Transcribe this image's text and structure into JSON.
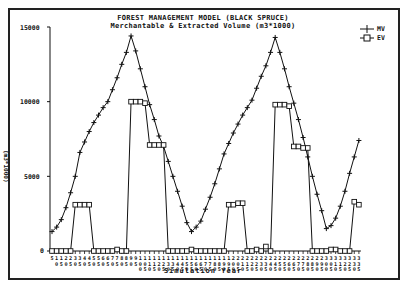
{
  "chart_data": {
    "type": "line",
    "title": "FOREST MANAGEMENT MODEL (BLACK SPRUCE)",
    "subtitle": "Merchantable & Extracted Volume (m3*1000)",
    "xlabel": "Simulation Year",
    "ylabel": "(m3*1000)",
    "ylim": [
      0,
      15000
    ],
    "yticks": [
      "0",
      "5000",
      "10000",
      "15000"
    ],
    "grid": false,
    "legend_position": "top-right",
    "x": [
      5,
      10,
      15,
      20,
      25,
      30,
      35,
      40,
      45,
      50,
      55,
      60,
      65,
      70,
      75,
      80,
      85,
      90,
      95,
      100,
      105,
      110,
      115,
      120,
      125,
      130,
      135,
      140,
      145,
      150,
      155,
      160,
      165,
      170,
      175,
      180,
      185,
      190,
      195,
      200,
      205,
      210,
      215,
      220,
      225,
      230,
      235,
      240,
      245,
      250,
      255,
      260,
      265,
      270,
      275,
      280,
      285,
      290,
      295,
      300,
      305,
      310,
      315,
      320,
      325,
      330,
      335
    ],
    "series": [
      {
        "name": "MV",
        "marker": "plus",
        "values": [
          1300,
          1600,
          2100,
          2900,
          3900,
          5000,
          6600,
          7300,
          8000,
          8600,
          9100,
          9600,
          10000,
          10800,
          11600,
          12500,
          13300,
          14400,
          13400,
          12200,
          11000,
          9800,
          8800,
          7700,
          7000,
          6000,
          5000,
          4000,
          3000,
          1900,
          1300,
          1600,
          2000,
          2800,
          3600,
          4500,
          5500,
          6500,
          7200,
          7900,
          8500,
          9100,
          9600,
          10100,
          10900,
          11700,
          12400,
          13300,
          14300,
          13300,
          12200,
          11000,
          9900,
          8800,
          7600,
          6300,
          5000,
          3800,
          2700,
          1500,
          1700,
          2200,
          3000,
          4000,
          5200,
          6300,
          7400
        ]
      },
      {
        "name": "EV",
        "marker": "square",
        "values": [
          0,
          0,
          0,
          0,
          0,
          3100,
          3100,
          3100,
          3100,
          0,
          0,
          0,
          0,
          0,
          100,
          0,
          0,
          10000,
          10000,
          10000,
          9900,
          7100,
          7100,
          7100,
          7100,
          0,
          0,
          0,
          0,
          0,
          100,
          0,
          0,
          0,
          0,
          0,
          0,
          0,
          3100,
          3100,
          3200,
          3200,
          0,
          0,
          100,
          0,
          300,
          0,
          9800,
          9800,
          9800,
          9700,
          7000,
          7000,
          6900,
          6900,
          0,
          0,
          0,
          0,
          100,
          100,
          0,
          0,
          0,
          3300,
          3100
        ]
      }
    ]
  },
  "header": {
    "title": "FOREST MANAGEMENT MODEL (BLACK SPRUCE)",
    "subtitle": "Merchantable & Extracted Volume (m3*1000)"
  },
  "axes": {
    "y_ticks": [
      {
        "label": "15000",
        "value": 15000
      },
      {
        "label": "10000",
        "value": 10000
      },
      {
        "label": "5000",
        "value": 5000
      },
      {
        "label": "0",
        "value": 0
      }
    ],
    "x_title": "Simulation Year",
    "y_title": "(m3*1000)"
  },
  "legend": {
    "items": [
      {
        "label": "MV",
        "icon": "plus-marker"
      },
      {
        "label": "EV",
        "icon": "square-marker"
      }
    ]
  }
}
